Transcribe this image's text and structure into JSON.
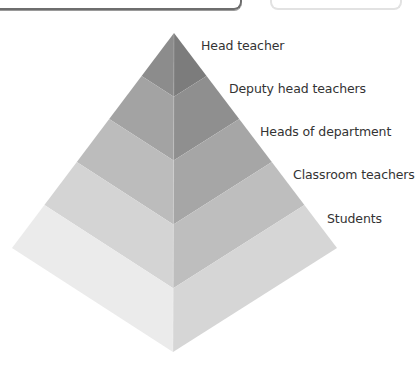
{
  "header": {
    "right_box_text": "instance?"
  },
  "pyramid": {
    "levels": [
      {
        "label": "Head teacher",
        "left_color": "#8c8c8c",
        "right_color": "#7c7c7c"
      },
      {
        "label": "Deputy head teachers",
        "left_color": "#a3a3a3",
        "right_color": "#8f8f8f"
      },
      {
        "label": "Heads of department",
        "left_color": "#bcbcbc",
        "right_color": "#a6a6a6"
      },
      {
        "label": "Classroom teachers",
        "left_color": "#d4d4d4",
        "right_color": "#bebebe"
      },
      {
        "label": "Students",
        "left_color": "#ebebeb",
        "right_color": "#d6d6d6"
      }
    ]
  }
}
